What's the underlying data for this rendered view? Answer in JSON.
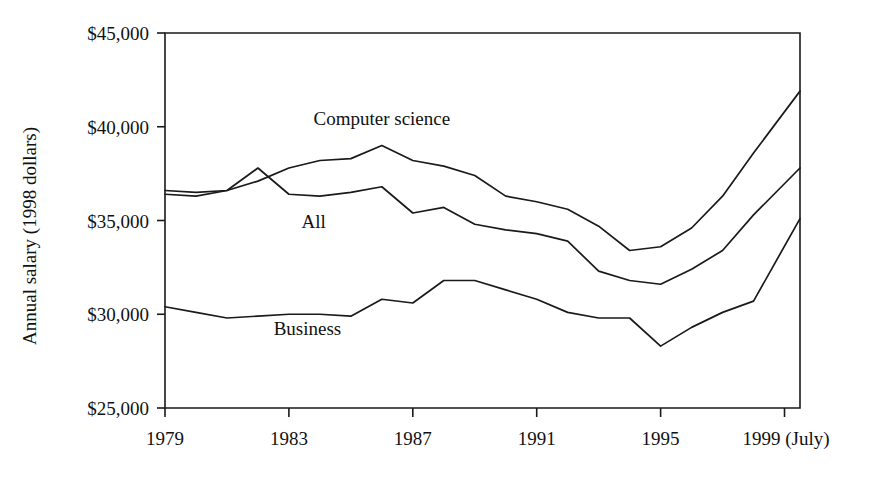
{
  "chart_data": {
    "type": "line",
    "title": "",
    "xlabel": "",
    "ylabel": "Annual salary (1998 dollars)",
    "xlim": [
      1979,
      1999.5
    ],
    "ylim": [
      25000,
      45000
    ],
    "grid": false,
    "legend_position": "inline-labels",
    "y_ticks": [
      {
        "value": 45000,
        "label": "$45,000"
      },
      {
        "value": 40000,
        "label": "$40,000"
      },
      {
        "value": 35000,
        "label": "$35,000"
      },
      {
        "value": 30000,
        "label": "$30,000"
      },
      {
        "value": 25000,
        "label": "$25,000"
      }
    ],
    "x_ticks": [
      {
        "value": 1979,
        "label": "1979"
      },
      {
        "value": 1983,
        "label": "1983"
      },
      {
        "value": 1987,
        "label": "1987"
      },
      {
        "value": 1991,
        "label": "1991"
      },
      {
        "value": 1995,
        "label": "1995"
      },
      {
        "value": 1999,
        "label": "1999 (July)"
      }
    ],
    "x": [
      1979,
      1980,
      1981,
      1982,
      1983,
      1984,
      1985,
      1986,
      1987,
      1988,
      1989,
      1990,
      1991,
      1992,
      1993,
      1994,
      1995,
      1996,
      1997,
      1998,
      1999.5
    ],
    "series": [
      {
        "name": "Computer science",
        "color": "#1a1a1a",
        "label_x": 1986.0,
        "label_y": 40100,
        "values": [
          36600,
          36500,
          36600,
          37100,
          37800,
          38200,
          38300,
          39000,
          38200,
          37900,
          37400,
          36300,
          36000,
          35600,
          34700,
          33400,
          33600,
          34600,
          36300,
          38600,
          41900
        ]
      },
      {
        "name": "All",
        "color": "#1a1a1a",
        "label_x": 1983.8,
        "label_y": 34600,
        "values": [
          36400,
          36300,
          36600,
          37800,
          36400,
          36300,
          36500,
          36800,
          35400,
          35700,
          34800,
          34500,
          34300,
          33900,
          32300,
          31800,
          31600,
          32400,
          33400,
          35300,
          37800
        ]
      },
      {
        "name": "Business",
        "color": "#1a1a1a",
        "label_x": 1983.6,
        "label_y": 28900,
        "values": [
          30400,
          30100,
          29800,
          29900,
          30000,
          30000,
          29900,
          30800,
          30600,
          31800,
          31800,
          31300,
          30800,
          30100,
          29800,
          29800,
          28300,
          29300,
          30100,
          30700,
          35100
        ]
      }
    ]
  },
  "axis": {
    "y_title": "Annual salary (1998 dollars)"
  }
}
